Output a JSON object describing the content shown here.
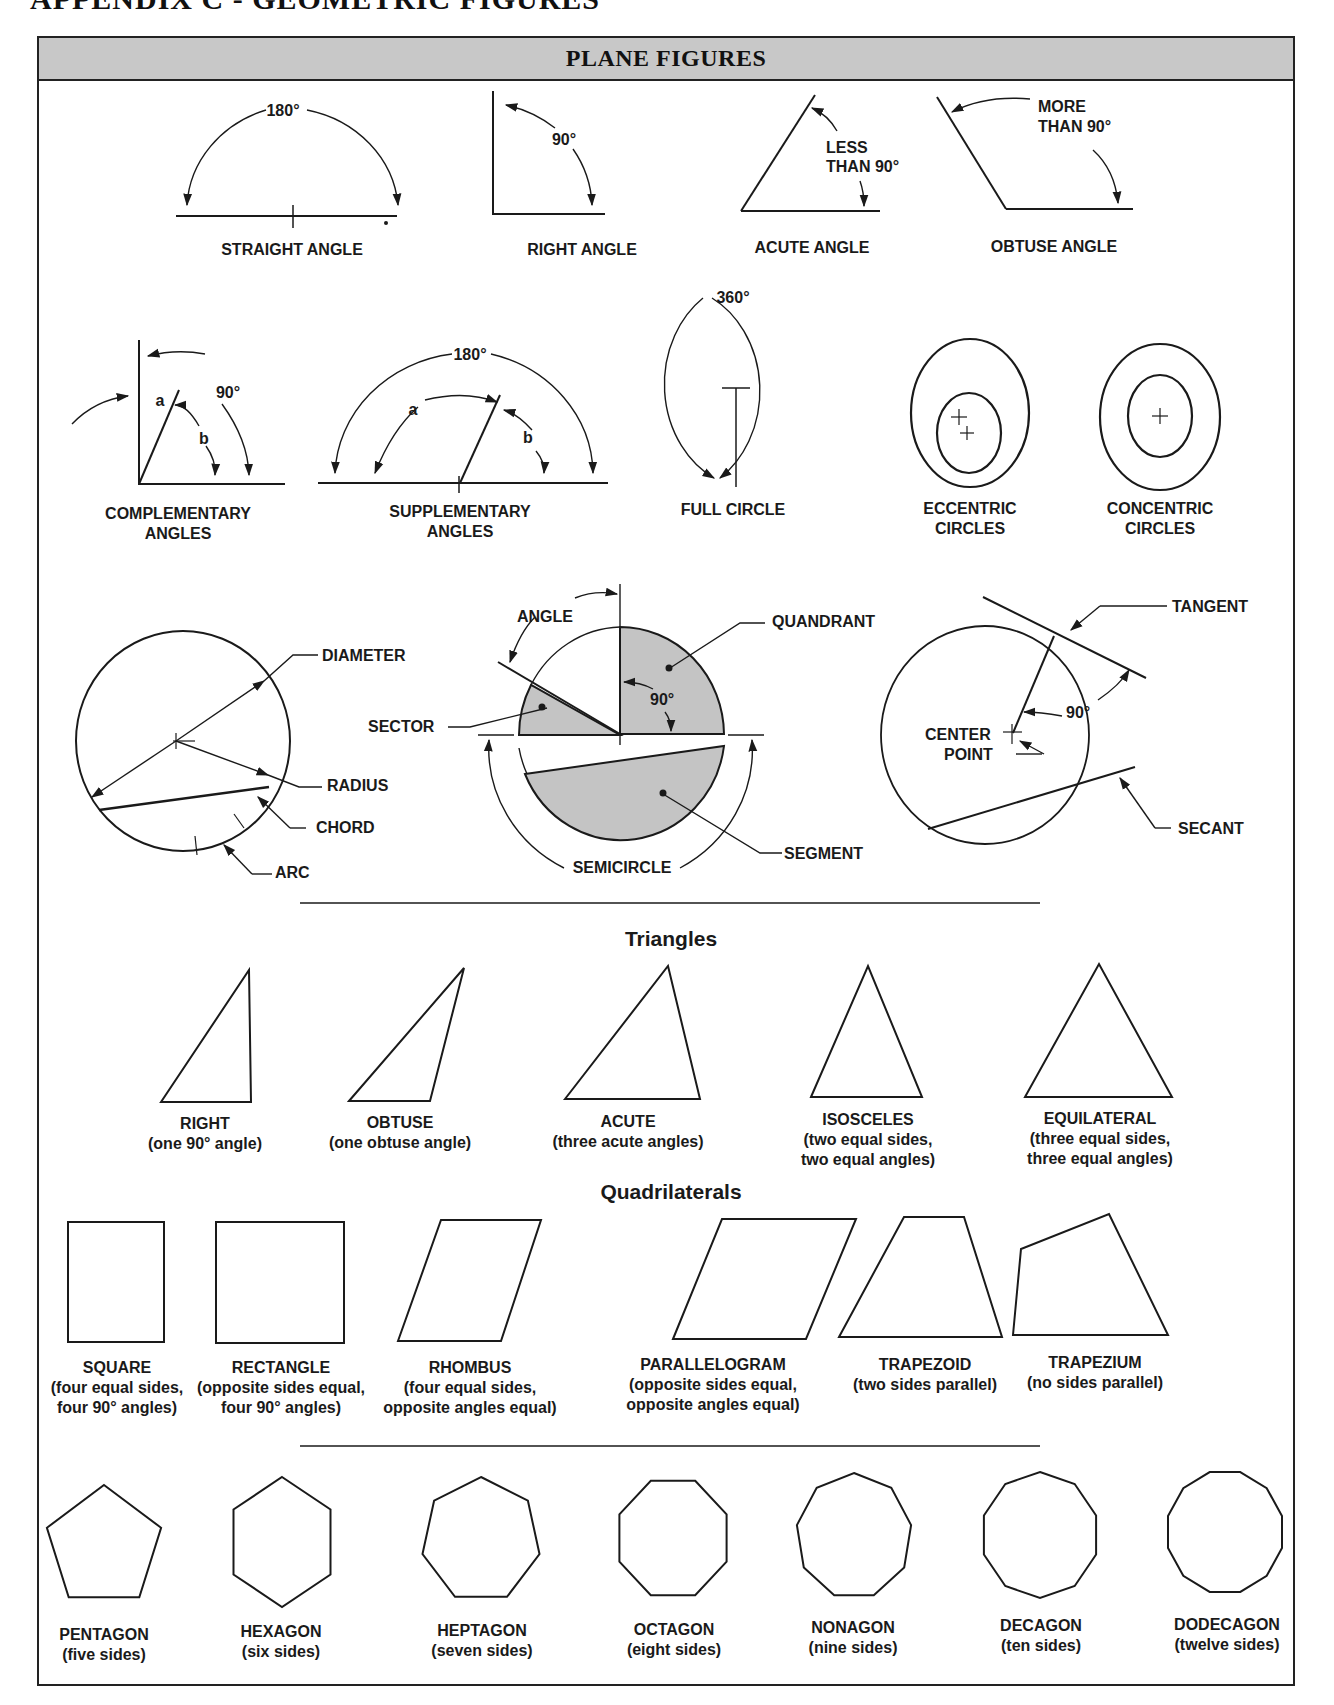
{
  "page": {
    "title": "APPENDIX C - GEOMETRIC FIGURES",
    "box_title": "PLANE FIGURES"
  },
  "colors": {
    "header_fill": "#c8c8c8",
    "shade_fill": "#c4c4c4",
    "line": "#1a1a1a"
  },
  "angles": {
    "straight": {
      "label": "STRAIGHT ANGLE",
      "measure": "180°"
    },
    "right": {
      "label": "RIGHT ANGLE",
      "measure": "90°"
    },
    "acute": {
      "label": "ACUTE ANGLE",
      "measure_line1": "LESS",
      "measure_line2": "THAN 90°"
    },
    "obtuse": {
      "label": "OBTUSE ANGLE",
      "measure_line1": "MORE",
      "measure_line2": "THAN 90°"
    },
    "complementary": {
      "label_line1": "COMPLEMENTARY",
      "label_line2": "ANGLES",
      "measure": "90°",
      "a": "a",
      "b": "b"
    },
    "supplementary": {
      "label_line1": "SUPPLEMENTARY",
      "label_line2": "ANGLES",
      "measure": "180°",
      "a": "a",
      "b": "b"
    }
  },
  "circles": {
    "full": {
      "label": "FULL CIRCLE",
      "measure": "360°"
    },
    "eccentric": {
      "label_line1": "ECCENTRIC",
      "label_line2": "CIRCLES"
    },
    "concentric": {
      "label_line1": "CONCENTRIC",
      "label_line2": "CIRCLES"
    }
  },
  "circle_parts": {
    "diameter": "DIAMETER",
    "radius": "RADIUS",
    "chord": "CHORD",
    "arc": "ARC",
    "angle": "ANGLE",
    "quadrant": "QUANDRANT",
    "sector": "SECTOR",
    "quadrant_angle": "90°",
    "segment": "SEGMENT",
    "semicircle": "SEMICIRCLE",
    "tangent": "TANGENT",
    "tangent_angle": "90°",
    "center_point_line1": "CENTER",
    "center_point_line2": "POINT",
    "secant": "SECANT"
  },
  "triangles": {
    "section_title": "Triangles",
    "items": [
      {
        "name": "RIGHT",
        "desc_line1": "(one 90° angle)",
        "desc_line2": ""
      },
      {
        "name": "OBTUSE",
        "desc_line1": "(one obtuse angle)",
        "desc_line2": ""
      },
      {
        "name": "ACUTE",
        "desc_line1": "(three acute angles)",
        "desc_line2": ""
      },
      {
        "name": "ISOSCELES",
        "desc_line1": "(two equal sides,",
        "desc_line2": "two equal angles)"
      },
      {
        "name": "EQUILATERAL",
        "desc_line1": "(three equal sides,",
        "desc_line2": "three equal angles)"
      }
    ]
  },
  "quadrilaterals": {
    "section_title": "Quadrilaterals",
    "items": [
      {
        "name": "SQUARE",
        "desc_line1": "(four equal sides,",
        "desc_line2": "four 90° angles)"
      },
      {
        "name": "RECTANGLE",
        "desc_line1": "(opposite sides equal,",
        "desc_line2": "four 90° angles)"
      },
      {
        "name": "RHOMBUS",
        "desc_line1": "(four equal sides,",
        "desc_line2": "opposite angles equal)"
      },
      {
        "name": "PARALLELOGRAM",
        "desc_line1": "(opposite sides equal,",
        "desc_line2": "opposite angles equal)"
      },
      {
        "name": "TRAPEZOID",
        "desc_line1": "(two sides parallel)",
        "desc_line2": ""
      },
      {
        "name": "TRAPEZIUM",
        "desc_line1": "(no sides parallel)",
        "desc_line2": ""
      }
    ]
  },
  "polygons": {
    "items": [
      {
        "name": "PENTAGON",
        "desc": "(five sides)",
        "sides": 5
      },
      {
        "name": "HEXAGON",
        "desc": "(six sides)",
        "sides": 6
      },
      {
        "name": "HEPTAGON",
        "desc": "(seven sides)",
        "sides": 7
      },
      {
        "name": "OCTAGON",
        "desc": "(eight sides)",
        "sides": 8
      },
      {
        "name": "NONAGON",
        "desc": "(nine sides)",
        "sides": 9
      },
      {
        "name": "DECAGON",
        "desc": "(ten sides)",
        "sides": 10
      },
      {
        "name": "DODECAGON",
        "desc": "(twelve sides)",
        "sides": 12
      }
    ]
  }
}
